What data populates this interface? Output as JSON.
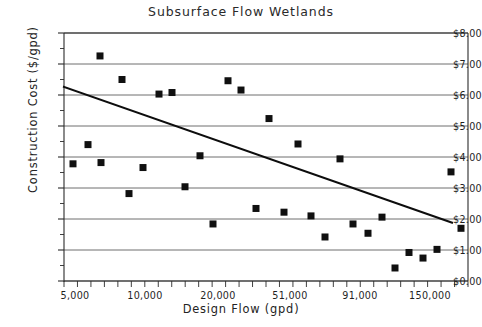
{
  "chart_data": {
    "type": "scatter",
    "title": "Subsurface Flow Wetlands",
    "xlabel": "Design Flow (gpd)",
    "ylabel": "Construction Cost ($/gpd)",
    "grid": true,
    "legend": "none",
    "x_axis": {
      "scale": "log-like-categorical",
      "tick_labels": [
        "5,000",
        "10,000",
        "20,000",
        "51,000",
        "91,000",
        "150,000"
      ],
      "tick_label_positions_px": [
        75,
        145,
        218,
        290,
        360,
        430
      ],
      "minor_tick_count": 30,
      "plot_left_px": 64,
      "plot_right_px": 468
    },
    "y_axis": {
      "ylim": [
        0,
        8
      ],
      "major_step": 1,
      "minor_step": 0.5,
      "tick_labels": [
        "$0.00",
        "$1.00",
        "$2.00",
        "$3.00",
        "$4.00",
        "$5.00",
        "$6.00",
        "$7.00",
        "$8.00"
      ],
      "tick_values": [
        0,
        1,
        2,
        3,
        4,
        5,
        6,
        7,
        8
      ],
      "plot_top_px": 33,
      "plot_bottom_px": 281
    },
    "points": [
      {
        "px": 73,
        "cost": 3.78
      },
      {
        "px": 88,
        "cost": 4.4
      },
      {
        "px": 100,
        "cost": 7.26
      },
      {
        "px": 101,
        "cost": 3.82
      },
      {
        "px": 122,
        "cost": 6.5
      },
      {
        "px": 129,
        "cost": 2.82
      },
      {
        "px": 143,
        "cost": 3.66
      },
      {
        "px": 159,
        "cost": 6.03
      },
      {
        "px": 172,
        "cost": 6.08
      },
      {
        "px": 185,
        "cost": 3.04
      },
      {
        "px": 200,
        "cost": 4.04
      },
      {
        "px": 213,
        "cost": 1.84
      },
      {
        "px": 228,
        "cost": 6.46
      },
      {
        "px": 241,
        "cost": 6.16
      },
      {
        "px": 256,
        "cost": 2.34
      },
      {
        "px": 269,
        "cost": 5.24
      },
      {
        "px": 284,
        "cost": 2.22
      },
      {
        "px": 298,
        "cost": 4.42
      },
      {
        "px": 311,
        "cost": 2.1
      },
      {
        "px": 325,
        "cost": 1.42
      },
      {
        "px": 340,
        "cost": 3.94
      },
      {
        "px": 353,
        "cost": 1.84
      },
      {
        "px": 368,
        "cost": 1.54
      },
      {
        "px": 382,
        "cost": 2.06
      },
      {
        "px": 395,
        "cost": 0.42
      },
      {
        "px": 409,
        "cost": 0.92
      },
      {
        "px": 423,
        "cost": 0.74
      },
      {
        "px": 437,
        "cost": 1.02
      },
      {
        "px": 451,
        "cost": 3.52
      },
      {
        "px": 461,
        "cost": 1.7
      }
    ],
    "trend_line": {
      "type": "linear-fit",
      "start": {
        "px": 64,
        "cost": 6.26
      },
      "end": {
        "px": 452,
        "cost": 1.88
      }
    }
  }
}
